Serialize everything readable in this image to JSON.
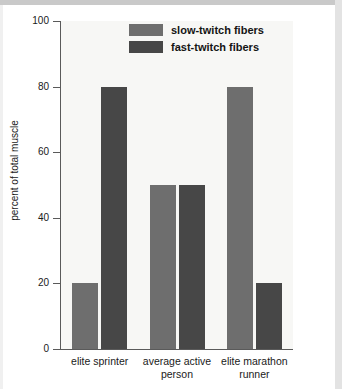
{
  "chart_data": {
    "type": "bar",
    "title": "",
    "subtitle": "",
    "xlabel": "",
    "ylabel": "percent of total muscle",
    "ylim": [
      0,
      100
    ],
    "yticks": [
      0,
      20,
      40,
      60,
      80,
      100
    ],
    "ytick_labels": [
      "0",
      "20",
      "40",
      "60",
      "80",
      "100"
    ],
    "grid": false,
    "legend_position": "top-center",
    "categories": [
      "elite sprinter",
      "average active person",
      "elite marathon runner"
    ],
    "category_lines": [
      [
        "elite sprinter"
      ],
      [
        "average active",
        "person"
      ],
      [
        "elite marathon",
        "runner"
      ]
    ],
    "series": [
      {
        "name": "slow-twitch fibers",
        "color": "#6e6e6e",
        "values": [
          20,
          50,
          80
        ]
      },
      {
        "name": "fast-twitch fibers",
        "color": "#474747",
        "values": [
          80,
          50,
          20
        ]
      }
    ]
  }
}
